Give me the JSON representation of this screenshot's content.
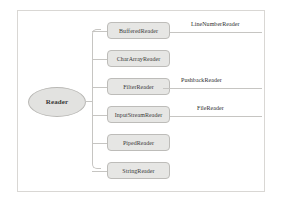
{
  "diagram": {
    "root": {
      "label": "Reader",
      "shape": "ellipse"
    },
    "children": [
      {
        "label": "BufferedReader",
        "top": 22
      },
      {
        "label": "CharArrayReader",
        "top": 50
      },
      {
        "label": "FilterReader",
        "top": 78
      },
      {
        "label": "InputStreamReader",
        "top": 106
      },
      {
        "label": "PipedReader",
        "top": 134
      },
      {
        "label": "StringReader",
        "top": 162
      }
    ],
    "branches": [
      {
        "label": "LineNumberReader",
        "from": "BufferedReader",
        "line_top": 32,
        "line_left": 170,
        "line_width": 92,
        "label_left": 191,
        "label_top": 21
      },
      {
        "label": "PushbackReader",
        "from": "FilterReader",
        "line_top": 88,
        "line_left": 163,
        "line_width": 99,
        "label_left": 181,
        "label_top": 77
      },
      {
        "label": "FileReader",
        "from": "InputStreamReader",
        "line_top": 116,
        "line_left": 170,
        "line_width": 92,
        "label_left": 197,
        "label_top": 105
      }
    ],
    "colors": {
      "node_fill": "#e6e6e4",
      "node_border": "#bdbcb9",
      "root_fill": "#e2e2e0",
      "connector": "#c6c5c2",
      "frame": "#d9d7d4",
      "text": "#3a3a3a",
      "background": "#ffffff"
    }
  }
}
